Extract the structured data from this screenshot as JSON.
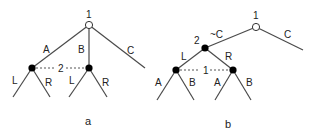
{
  "diagram": {
    "tree_a": {
      "caption": "a",
      "root": {
        "player": "1",
        "type": "open"
      },
      "root_actions": [
        "A",
        "B",
        "C"
      ],
      "info_set_label": "2",
      "subtree_actions": [
        "L",
        "R"
      ],
      "left_subtree": [
        "L",
        "R"
      ],
      "middle_subtree": [
        "L",
        "R"
      ]
    },
    "tree_b": {
      "caption": "b",
      "root": {
        "player": "1",
        "type": "open"
      },
      "root_actions": [
        "~C",
        "C"
      ],
      "node2_label": "2",
      "node2_actions": [
        "L",
        "R"
      ],
      "info_set_label": "1",
      "left_subtree": [
        "A",
        "B"
      ],
      "right_subtree": [
        "A",
        "B"
      ]
    },
    "colors": {
      "line": "#4a4a4a",
      "filled_node": "#000000",
      "open_node": "#ffffff",
      "text": "#222222"
    }
  }
}
